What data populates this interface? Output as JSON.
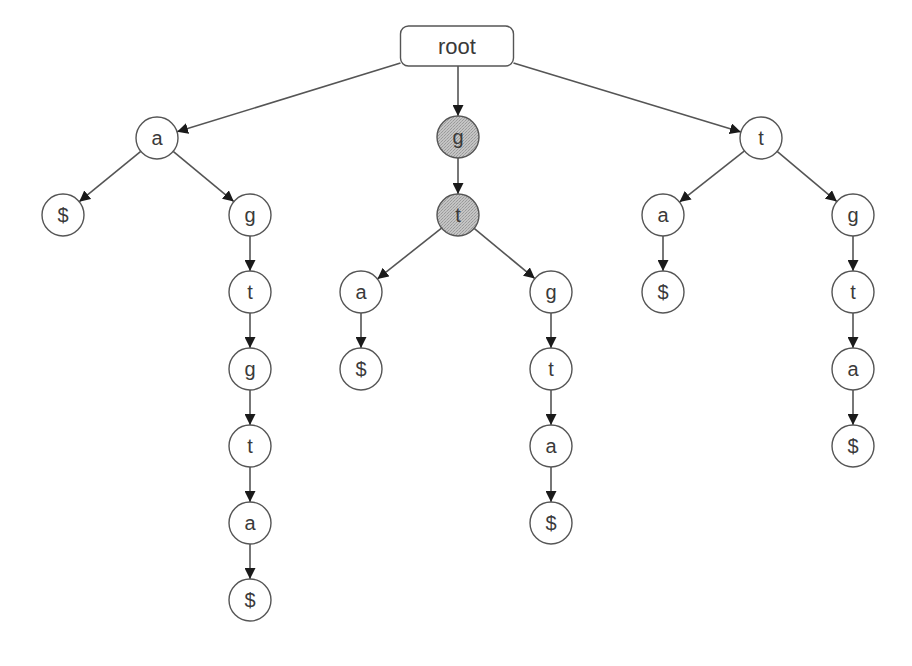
{
  "diagram": {
    "root": {
      "id": "root",
      "label": "root",
      "x": 457,
      "y": 46,
      "width": 113,
      "height": 40
    },
    "colors": {
      "node_fill": "#ffffff",
      "highlight_fill": "#bbbbbb",
      "stroke": "#555555",
      "text": "#3a3a3a",
      "arrow": "#1a1a1a"
    },
    "node_radius": 21,
    "nodes": [
      {
        "id": "a1",
        "label": "a",
        "x": 157,
        "y": 138,
        "highlighted": false
      },
      {
        "id": "a1_end",
        "label": "$",
        "x": 63,
        "y": 215,
        "highlighted": false
      },
      {
        "id": "a1_g",
        "label": "g",
        "x": 250,
        "y": 215,
        "highlighted": false
      },
      {
        "id": "a1_g_t",
        "label": "t",
        "x": 250,
        "y": 292,
        "highlighted": false
      },
      {
        "id": "a1_g_t_g",
        "label": "g",
        "x": 250,
        "y": 369,
        "highlighted": false
      },
      {
        "id": "a1_g_t_g_t",
        "label": "t",
        "x": 250,
        "y": 446,
        "highlighted": false
      },
      {
        "id": "a1_g_t_g_t_a",
        "label": "a",
        "x": 250,
        "y": 523,
        "highlighted": false
      },
      {
        "id": "a1_g_t_g_t_a_end",
        "label": "$",
        "x": 250,
        "y": 600,
        "highlighted": false
      },
      {
        "id": "g1",
        "label": "g",
        "x": 458,
        "y": 137,
        "highlighted": true
      },
      {
        "id": "g1_t",
        "label": "t",
        "x": 458,
        "y": 215,
        "highlighted": true
      },
      {
        "id": "g1_t_a",
        "label": "a",
        "x": 361,
        "y": 292,
        "highlighted": false
      },
      {
        "id": "g1_t_a_end",
        "label": "$",
        "x": 361,
        "y": 369,
        "highlighted": false
      },
      {
        "id": "g1_t_g",
        "label": "g",
        "x": 551,
        "y": 292,
        "highlighted": false
      },
      {
        "id": "g1_t_g_t",
        "label": "t",
        "x": 551,
        "y": 369,
        "highlighted": false
      },
      {
        "id": "g1_t_g_t_a",
        "label": "a",
        "x": 551,
        "y": 446,
        "highlighted": false
      },
      {
        "id": "g1_t_g_t_a_end",
        "label": "$",
        "x": 551,
        "y": 523,
        "highlighted": false
      },
      {
        "id": "t1",
        "label": "t",
        "x": 761,
        "y": 138,
        "highlighted": false
      },
      {
        "id": "t1_a",
        "label": "a",
        "x": 663,
        "y": 215,
        "highlighted": false
      },
      {
        "id": "t1_a_end",
        "label": "$",
        "x": 663,
        "y": 292,
        "highlighted": false
      },
      {
        "id": "t1_g",
        "label": "g",
        "x": 853,
        "y": 215,
        "highlighted": false
      },
      {
        "id": "t1_g_t",
        "label": "t",
        "x": 853,
        "y": 292,
        "highlighted": false
      },
      {
        "id": "t1_g_t_a",
        "label": "a",
        "x": 853,
        "y": 369,
        "highlighted": false
      },
      {
        "id": "t1_g_t_a_end",
        "label": "$",
        "x": 853,
        "y": 446,
        "highlighted": false
      }
    ],
    "edges": [
      [
        "root",
        "a1"
      ],
      [
        "root",
        "g1"
      ],
      [
        "root",
        "t1"
      ],
      [
        "a1",
        "a1_end"
      ],
      [
        "a1",
        "a1_g"
      ],
      [
        "a1_g",
        "a1_g_t"
      ],
      [
        "a1_g_t",
        "a1_g_t_g"
      ],
      [
        "a1_g_t_g",
        "a1_g_t_g_t"
      ],
      [
        "a1_g_t_g_t",
        "a1_g_t_g_t_a"
      ],
      [
        "a1_g_t_g_t_a",
        "a1_g_t_g_t_a_end"
      ],
      [
        "g1",
        "g1_t"
      ],
      [
        "g1_t",
        "g1_t_a"
      ],
      [
        "g1_t_a",
        "g1_t_a_end"
      ],
      [
        "g1_t",
        "g1_t_g"
      ],
      [
        "g1_t_g",
        "g1_t_g_t"
      ],
      [
        "g1_t_g_t",
        "g1_t_g_t_a"
      ],
      [
        "g1_t_g_t_a",
        "g1_t_g_t_a_end"
      ],
      [
        "t1",
        "t1_a"
      ],
      [
        "t1_a",
        "t1_a_end"
      ],
      [
        "t1",
        "t1_g"
      ],
      [
        "t1_g",
        "t1_g_t"
      ],
      [
        "t1_g_t",
        "t1_g_t_a"
      ],
      [
        "t1_g_t_a",
        "t1_g_t_a_end"
      ]
    ]
  }
}
